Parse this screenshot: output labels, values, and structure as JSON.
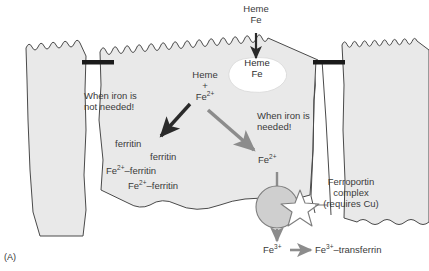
{
  "figure": {
    "panel_label": "(A)",
    "title_description": "Intestinal enterocyte iron absorption diagram"
  },
  "labels": {
    "heme_fe_source": "Heme\nFe",
    "heme_fe_vesicle": "Heme\nFe",
    "heme_plus_fe": "Heme\n+\nFe2+",
    "when_iron_not_needed": "When iron is\nnot needed!",
    "when_iron_needed": "When iron is\nneeded!",
    "ferritin_1": "ferritin",
    "ferritin_2": "ferritin",
    "fe_ferritin_1": "Fe2+–ferritin",
    "fe_ferritin_2": "Fe2+–ferritin",
    "fe2_cytosol": "Fe2+",
    "ferroportin_complex": "Ferroportin\ncomplex\n(requires Cu)",
    "fe3_exported": "Fe3+",
    "fe3_transferrin": "Fe3+–transferrin"
  },
  "icons": {
    "uptake_arrow": "down-arrow-icon",
    "storage_arrow": "down-left-arrow-icon",
    "export_arrow": "down-right-arrow-icon",
    "ferroportin_in_arrow": "down-arrow-icon",
    "ferroportin_out_arrow": "down-arrow-icon",
    "transferrin_arrow": "right-arrow-icon",
    "ferroportin_star": "star-icon",
    "ferroportin_circle": "circle-icon",
    "tight_junction_left": "tight-junction-bar-icon",
    "tight_junction_right": "tight-junction-bar-icon",
    "heme_vesicle": "vesicle-blob-icon"
  },
  "colors": {
    "cell_fill": "#e9e9e9",
    "cell_stroke": "#4a4a4a",
    "dark_arrow": "#2a2a2a",
    "gray_arrow": "#8c8c8c",
    "text": "#3a3a3a",
    "tight_junction": "#1a1a1a",
    "vesicle_fill": "#ffffff",
    "background": "#ffffff"
  }
}
